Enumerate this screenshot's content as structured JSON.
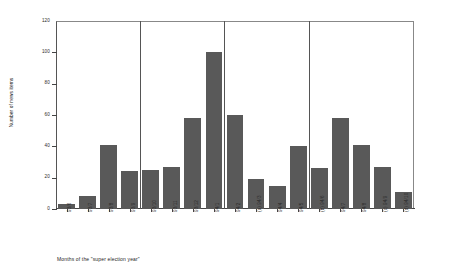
{
  "chart_data": {
    "type": "bar",
    "title": "",
    "xlabel": "Months of the \"super election year\"",
    "ylabel": "Number of news items",
    "ylim": [
      0,
      120
    ],
    "yticks": [
      0,
      20,
      40,
      60,
      80,
      100,
      120
    ],
    "grid": false,
    "legend": null,
    "bar_color": "#595959",
    "categories": [
      "93/6",
      "93/7",
      "93/8",
      "93/9",
      "93/10",
      "93/11",
      "93/12",
      "94/1",
      "94/2",
      "(a) 94/3",
      "94/4",
      "94/5",
      "(b) 94/6",
      "94/7",
      "94/8",
      "(c) 94/9",
      "(d) 94/10"
    ],
    "values": [
      3,
      8,
      41,
      24,
      25,
      27,
      58,
      100,
      60,
      19,
      15,
      40,
      26,
      58,
      41,
      27,
      11
    ],
    "group_separators_after": [
      4,
      8,
      12
    ],
    "annotations": []
  },
  "axis": {
    "y_title": "Number of news items",
    "x_title": "Months of the \"super election year\"",
    "y_tick_labels": [
      "0",
      "20",
      "40",
      "60",
      "80",
      "100",
      "120"
    ]
  }
}
